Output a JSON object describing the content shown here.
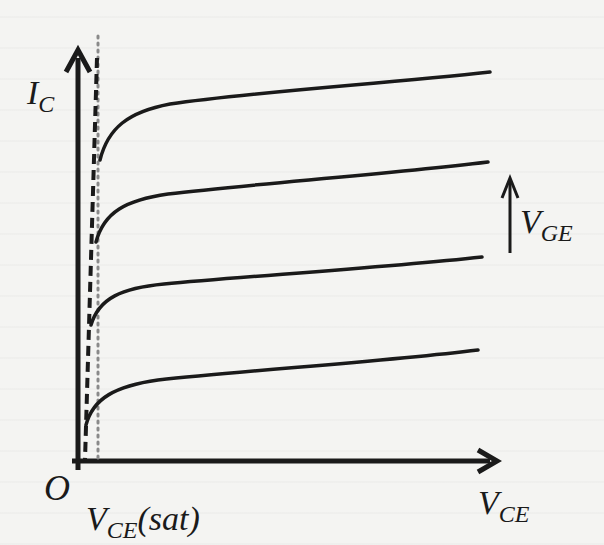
{
  "figure": {
    "type": "IGBT output characteristics",
    "axes": {
      "y_label": {
        "main": "I",
        "sub": "C"
      },
      "x_label": {
        "main": "V",
        "sub": "CE"
      },
      "origin_label": "O"
    },
    "annotations": {
      "vce_sat": {
        "main": "V",
        "sub": "CE",
        "suffix": "(sat)"
      },
      "vge_arrow": {
        "main": "V",
        "sub": "GE",
        "direction": "increasing upward"
      }
    },
    "curves": [
      {
        "name": "V_GE level 4 (highest)",
        "start": [
          100,
          160
        ],
        "knee": [
          150,
          100
        ],
        "end": [
          490,
          72
        ]
      },
      {
        "name": "V_GE level 3",
        "start": [
          96,
          242
        ],
        "knee": [
          150,
          195
        ],
        "end": [
          488,
          162
        ]
      },
      {
        "name": "V_GE level 2",
        "start": [
          91,
          325
        ],
        "knee": [
          150,
          285
        ],
        "end": [
          482,
          257
        ]
      },
      {
        "name": "V_GE level 1 (lowest)",
        "start": [
          86,
          425
        ],
        "knee": [
          150,
          382
        ],
        "end": [
          478,
          350
        ]
      }
    ],
    "reference_lines": {
      "dashed": "saturation boundary line",
      "dotted": "V_CE(sat) vertical marker"
    },
    "colors": {
      "ink": "#1a1a1a",
      "background": "#f4f4f2",
      "dotted": "#8a8a8a"
    }
  }
}
